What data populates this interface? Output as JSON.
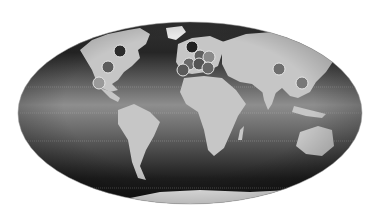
{
  "map": {
    "projection": "Mollweide",
    "style": "grayscale",
    "ellipse": {
      "cx": 190,
      "cy": 113,
      "rx": 172,
      "ry": 91
    },
    "colors": {
      "background": "#ffffff",
      "ocean_top": "#2a2a2a",
      "ocean_mid": "#8a8a8a",
      "ocean_bottom": "#1c1c1c",
      "land": "#c4c4c4",
      "ice": "#f2f2f2",
      "marker_stroke": "#e6e6e6"
    },
    "markers": [
      {
        "region": "north-america",
        "x": 120,
        "y": 51,
        "r": 6,
        "fill": "#2c2c2c"
      },
      {
        "region": "north-america",
        "x": 108,
        "y": 67,
        "r": 6,
        "fill": "#5c5c5c"
      },
      {
        "region": "north-america",
        "x": 99,
        "y": 83,
        "r": 6,
        "fill": "#9a9a9a"
      },
      {
        "region": "europe",
        "x": 192,
        "y": 47,
        "r": 6,
        "fill": "#222222"
      },
      {
        "region": "europe",
        "x": 200,
        "y": 56,
        "r": 6,
        "fill": "#606060"
      },
      {
        "region": "europe",
        "x": 209,
        "y": 57,
        "r": 6,
        "fill": "#8a8a8a"
      },
      {
        "region": "europe",
        "x": 189,
        "y": 64,
        "r": 6,
        "fill": "#6a6a6a"
      },
      {
        "region": "europe",
        "x": 199,
        "y": 64,
        "r": 6,
        "fill": "#545454"
      },
      {
        "region": "europe",
        "x": 208,
        "y": 68,
        "r": 6,
        "fill": "#666666"
      },
      {
        "region": "europe",
        "x": 183,
        "y": 70,
        "r": 6,
        "fill": "#5a5a5a"
      },
      {
        "region": "asia",
        "x": 279,
        "y": 69,
        "r": 6,
        "fill": "#6e6e6e"
      },
      {
        "region": "asia",
        "x": 302,
        "y": 83,
        "r": 6,
        "fill": "#787878"
      }
    ],
    "gridlines": [
      "equator",
      "tropic-of-cancer",
      "tropic-of-capricorn",
      "antarctic-circle"
    ]
  }
}
